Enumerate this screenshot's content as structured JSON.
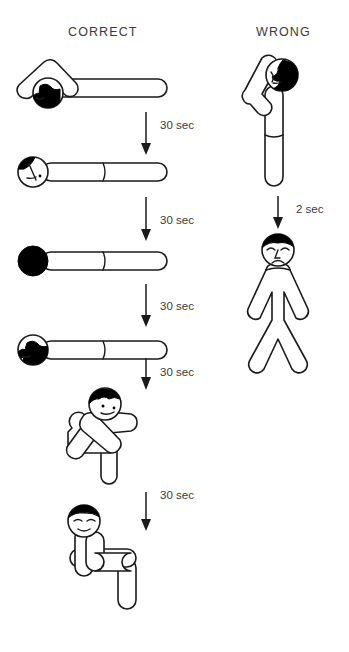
{
  "page": {
    "background_color": "#ffffff",
    "line_color": "#1a1a1a",
    "text_color": "#3a3a3a"
  },
  "columns": [
    {
      "id": "correct",
      "label": "CORRECT"
    },
    {
      "id": "wrong",
      "label": "WRONG"
    }
  ],
  "correct_sequence": {
    "steps": [
      {
        "index": 1,
        "name": "lying-prone-arm-overhead",
        "description": "Person lying face down, one arm bent above the head, face turned down",
        "head_state": "face-down-hair-visible"
      },
      {
        "index": 2,
        "name": "lying-head-turned-profile",
        "description": "Person lying flat, head turned showing profile of face",
        "head_state": "profile-face"
      },
      {
        "index": 3,
        "name": "lying-head-fully-down",
        "description": "Person lying flat, head fully face down (solid black)",
        "head_state": "solid-black"
      },
      {
        "index": 4,
        "name": "lying-head-turned-other-side",
        "description": "Person lying flat, head turned to the other side showing face",
        "head_state": "profile-face-reversed"
      },
      {
        "index": 5,
        "name": "curled-side-recovery",
        "description": "Person curled on side with arms crossed and knees bent",
        "head_state": "face-visible-side"
      },
      {
        "index": 6,
        "name": "seated-upright",
        "description": "Person seated upright, relaxed and smiling",
        "head_state": "smiling-face"
      }
    ],
    "transitions": [
      {
        "after_step": 1,
        "label": "30 sec"
      },
      {
        "after_step": 2,
        "label": "30 sec"
      },
      {
        "after_step": 3,
        "label": "30 sec"
      },
      {
        "after_step": 4,
        "label": "30 sec"
      },
      {
        "after_step": 5,
        "label": "30 sec"
      }
    ]
  },
  "wrong_sequence": {
    "steps": [
      {
        "index": 1,
        "name": "standing-arm-raised",
        "description": "Person standing upright with arm bent above the head",
        "head_state": "profile-face"
      },
      {
        "index": 2,
        "name": "standing-distressed",
        "description": "Person standing with arms and legs spread, distressed expression",
        "head_state": "sad-face"
      }
    ],
    "transitions": [
      {
        "after_step": 1,
        "label": "2 sec"
      }
    ]
  }
}
